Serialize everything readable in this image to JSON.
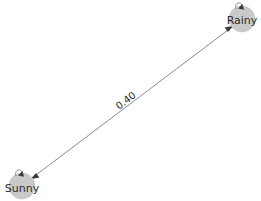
{
  "diagram": {
    "type": "state-transition-graph",
    "background_color": "#ffffff",
    "node_fill_color": "#c9c9c9",
    "edge_color": "#8a8a93",
    "label_color": "#2b2b2b",
    "nodes": [
      {
        "id": "sunny",
        "label": "Sunny",
        "x": 22,
        "y": 186,
        "radius": 13
      },
      {
        "id": "rainy",
        "label": "Rainy",
        "x": 242,
        "y": 19,
        "radius": 13
      }
    ],
    "edges": [
      {
        "id": "sunny-rainy",
        "from": "sunny",
        "to": "rainy",
        "weight": "0.40",
        "directed": "both",
        "label_x": 126,
        "label_y": 101
      }
    ],
    "self_loops": [
      {
        "id": "sunny-self-loop",
        "node": "sunny"
      },
      {
        "id": "rainy-self-loop",
        "node": "rainy"
      }
    ]
  }
}
